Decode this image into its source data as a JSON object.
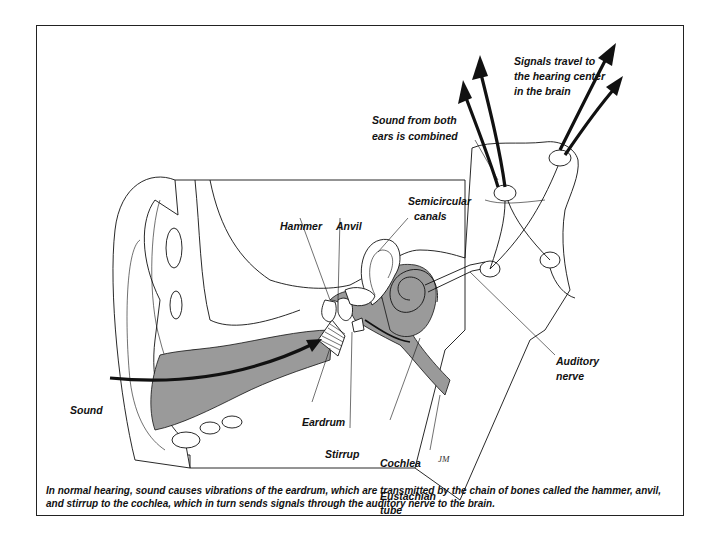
{
  "figure": {
    "labels": {
      "signals": [
        "Signals travel to",
        "the hearing center",
        "in the brain"
      ],
      "combined": [
        "Sound from both",
        "ears is combined"
      ],
      "semicircular": [
        "Semicircular",
        "canals"
      ],
      "hammer": "Hammer",
      "anvil": "Anvil",
      "auditory_nerve": [
        "Auditory",
        "nerve"
      ],
      "sound": "Sound",
      "eardrum": "Eardrum",
      "stirrup": "Stirrup",
      "cochlea": "Cochlea",
      "eustachian": [
        "Eustachian",
        "tube"
      ],
      "signature": "JM"
    },
    "caption": "In normal hearing, sound causes vibrations of the eardrum, which are transmitted by the chain of bones called the hammer, anvil, and stirrup to the cochlea, which in turn sends signals through the auditory nerve to the brain.",
    "colors": {
      "shade": "#9a9a9a",
      "line": "#111111",
      "background": "#ffffff"
    }
  }
}
